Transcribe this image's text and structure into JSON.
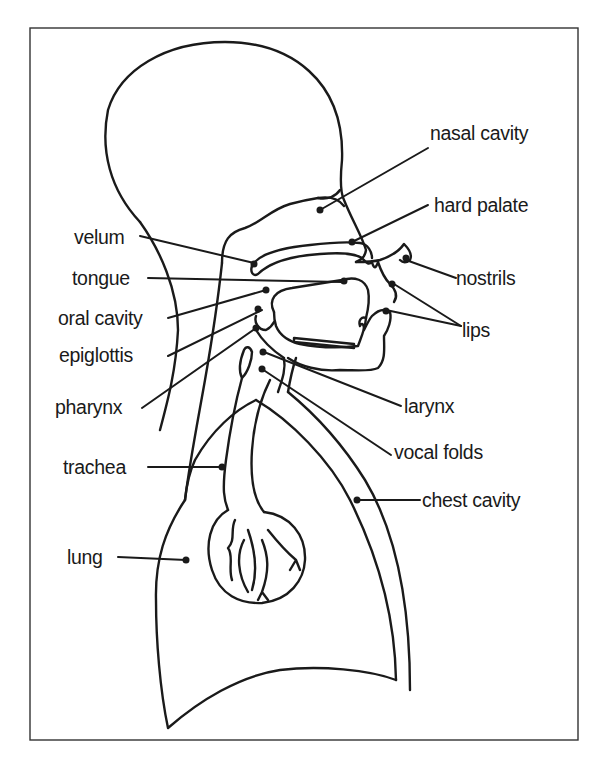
{
  "diagram": {
    "labels": {
      "nasal_cavity": "nasal cavity",
      "hard_palate": "hard palate",
      "velum": "velum",
      "tongue": "tongue",
      "oral_cavity": "oral cavity",
      "epiglottis": "epiglottis",
      "pharynx": "pharynx",
      "trachea": "trachea",
      "lung": "lung",
      "nostrils": "nostrils",
      "lips": "lips",
      "larynx": "larynx",
      "vocal_folds": "vocal folds",
      "chest_cavity": "chest cavity"
    },
    "colors": {
      "ink": "#1a1a1a",
      "background": "#ffffff",
      "frame": "#333333"
    }
  }
}
